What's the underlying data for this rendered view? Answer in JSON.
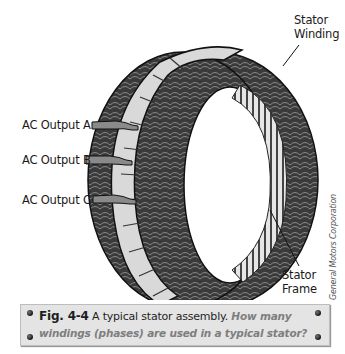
{
  "labels": {
    "stator_winding_line1": "Stator",
    "stator_winding_line2": "Winding",
    "ac_output_a": "AC Output A",
    "ac_output_b": "AC Output B",
    "ac_output_c": "AC Output C",
    "stator_frame_line1": "Stator",
    "stator_frame_line2": "Frame"
  },
  "credit": "General Motors Corporation",
  "caption": {
    "fig_number": "Fig. 4-4",
    "title": "A typical stator assembly.",
    "question_part1": "How many",
    "question_part2": "windings (phases) are used in a typical stator?"
  },
  "colors": {
    "winding": "#3c3c3c",
    "frame_band": "#d9d9d9",
    "caption_bg": "#e4e4e4",
    "question_text": "#7e7e7e"
  }
}
